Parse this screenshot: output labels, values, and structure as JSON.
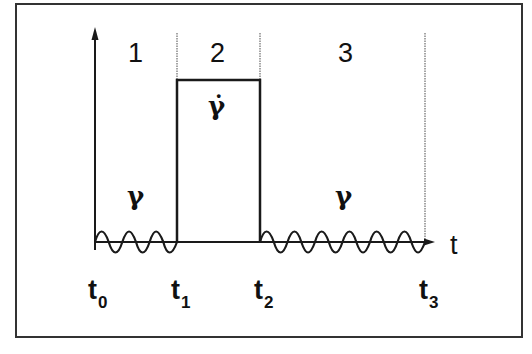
{
  "diagram": {
    "regions": [
      {
        "id": "1",
        "label": "1",
        "symbol": "γ",
        "type": "oscillatory"
      },
      {
        "id": "2",
        "label": "2",
        "symbol": "γ̇",
        "type": "step-rate"
      },
      {
        "id": "3",
        "label": "3",
        "symbol": "γ",
        "type": "oscillatory"
      }
    ],
    "axis": {
      "x_label": "t"
    },
    "time_marks": [
      {
        "base": "t",
        "sub": "0"
      },
      {
        "base": "t",
        "sub": "1"
      },
      {
        "base": "t",
        "sub": "2"
      },
      {
        "base": "t",
        "sub": "3"
      }
    ],
    "colors": {
      "line": "#1a1a1a",
      "divider": "#888888",
      "frame": "#333333",
      "background": "#ffffff"
    }
  }
}
